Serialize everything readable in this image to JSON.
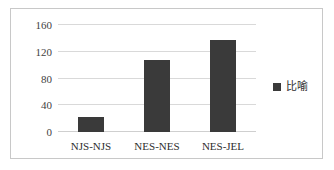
{
  "chart_data": {
    "type": "bar",
    "title": "",
    "xlabel": "",
    "ylabel": "",
    "categories": [
      "NJS-NJS",
      "NES-NES",
      "NES-JEL"
    ],
    "values": [
      23,
      108,
      138
    ],
    "series": [
      {
        "name": "比喻",
        "values": [
          23,
          108,
          138
        ]
      }
    ],
    "ylim": [
      0,
      160
    ],
    "yticks": [
      0,
      40,
      80,
      120,
      160
    ],
    "ytick_labels": [
      "0",
      "40",
      "80",
      "120",
      "160"
    ],
    "grid": true,
    "legend": {
      "position": "right",
      "entries": [
        "比喻"
      ]
    },
    "colors": {
      "bar": "#3a3a3a",
      "gridline": "#d9d9d9",
      "border": "#c8c8c8",
      "text": "#2e2e2e"
    }
  }
}
